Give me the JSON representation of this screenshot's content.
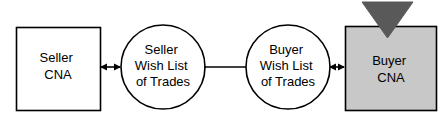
{
  "diagram": {
    "type": "flow-diagram",
    "background_color": "#ffffff",
    "stroke_color": "#000000",
    "nodes": [
      {
        "id": "seller-cna",
        "shape": "rectangle",
        "fill": "#ffffff",
        "stroke": "#000000",
        "label_lines": [
          "Seller",
          "CNA"
        ],
        "line1": "Seller",
        "line2": "CNA"
      },
      {
        "id": "seller-wish-list",
        "shape": "circle",
        "fill": "#ffffff",
        "stroke": "#000000",
        "label_lines": [
          "Seller",
          "Wish List",
          "of Trades"
        ],
        "line1": "Seller",
        "line2": "Wish List",
        "line3": "of Trades"
      },
      {
        "id": "buyer-wish-list",
        "shape": "circle",
        "fill": "#ffffff",
        "stroke": "#000000",
        "label_lines": [
          "Buyer",
          "Wish List",
          "of Trades"
        ],
        "line1": "Buyer",
        "line2": "Wish List",
        "line3": "of Trades"
      },
      {
        "id": "buyer-cna",
        "shape": "rectangle",
        "fill": "#c8c8c8",
        "stroke": "#000000",
        "label_lines": [
          "Buyer",
          "CNA"
        ],
        "line1": "Buyer",
        "line2": "CNA"
      }
    ],
    "markers": [
      {
        "id": "buyer-cna-triangle",
        "shape": "triangle-down",
        "fill": "#595959",
        "stroke": "#595959"
      }
    ],
    "connectors": [
      {
        "id": "seller-cna-to-seller-wish-list",
        "from": "seller-cna",
        "to": "seller-wish-list",
        "style": "double-arrow"
      },
      {
        "id": "seller-wish-list-to-buyer-wish-list",
        "from": "seller-wish-list",
        "to": "buyer-wish-list",
        "style": "plain-line"
      },
      {
        "id": "buyer-wish-list-to-buyer-cna",
        "from": "buyer-wish-list",
        "to": "buyer-cna",
        "style": "double-arrow"
      }
    ]
  }
}
